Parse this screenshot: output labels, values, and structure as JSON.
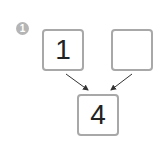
{
  "problem": {
    "number": "1",
    "top_left": "1",
    "top_right": "",
    "bottom": "4"
  }
}
